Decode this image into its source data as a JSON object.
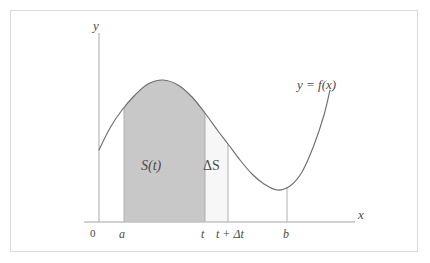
{
  "figure": {
    "background_color": "#ffffff",
    "frame_color": "#d9d9d9"
  },
  "axes": {
    "y_label": "y",
    "x_label": "x",
    "origin_label": "0",
    "axis_color": "#b0b0b0"
  },
  "curve": {
    "label": "y = f(x)",
    "color": "#6e6e6e"
  },
  "regions": {
    "main": {
      "label": "S(t)",
      "fill": "#c8c8c8",
      "from": "a",
      "to": "t"
    },
    "increment": {
      "label": "ΔS",
      "fill": "#f7f7f7",
      "from": "t",
      "to": "t + Δt"
    }
  },
  "ticks": [
    {
      "label": "a",
      "x": 124
    },
    {
      "label": "t",
      "x": 205
    },
    {
      "label": "t + Δt",
      "x": 228
    },
    {
      "label": "b",
      "x": 287
    }
  ],
  "tick_labels": {
    "a": "a",
    "t": "t",
    "t_plus_dt": "t + Δt",
    "b": "b"
  },
  "chart_data": {
    "type": "line",
    "title": "",
    "xlabel": "x",
    "ylabel": "y",
    "legend": [
      "y = f(x)"
    ],
    "grid": false,
    "annotations": [
      "S(t)",
      "ΔS",
      "0",
      "a",
      "t",
      "t + Δt",
      "b"
    ],
    "x_markers": {
      "a": 124,
      "t": 205,
      "t_plus_delta_t": 228,
      "b": 287
    },
    "series": [
      {
        "name": "y = f(x)",
        "points": [
          [
            99,
            150
          ],
          [
            110,
            128
          ],
          [
            122,
            110
          ],
          [
            135,
            95
          ],
          [
            148,
            84
          ],
          [
            163,
            80
          ],
          [
            178,
            85
          ],
          [
            192,
            97
          ],
          [
            205,
            113
          ],
          [
            218,
            131
          ],
          [
            228,
            144
          ],
          [
            240,
            160
          ],
          [
            252,
            174
          ],
          [
            264,
            184
          ],
          [
            277,
            190
          ],
          [
            290,
            186
          ],
          [
            302,
            172
          ],
          [
            314,
            145
          ],
          [
            324,
            115
          ],
          [
            330,
            90
          ]
        ]
      }
    ]
  }
}
